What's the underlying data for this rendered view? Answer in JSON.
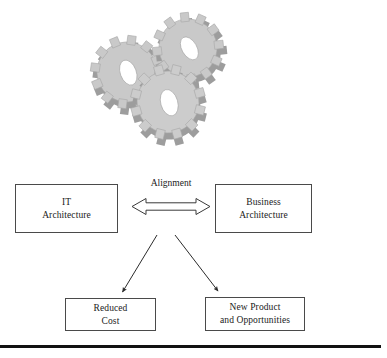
{
  "figure": {
    "name": "it-business-architecture-alignment-diagram",
    "background_color": "#ffffff",
    "illustration": {
      "name": "three-interlocking-gears",
      "gear_count": 3,
      "face_color": "#c9c9c9",
      "shade_color": "#9a9a9a",
      "edge_color": "#8c8c8c",
      "hub_color": "#ffffff"
    },
    "connector_color": "#333333",
    "box_border_color": "#4a4a4a",
    "rule_color": "#111111"
  },
  "diagram": {
    "alignment_label": "Alignment",
    "nodes": [
      {
        "id": "it-architecture",
        "lines": [
          "IT",
          "Architecture"
        ]
      },
      {
        "id": "business-architecture",
        "lines": [
          "Business",
          "Architecture"
        ]
      },
      {
        "id": "reduced-cost",
        "lines": [
          "Reduced",
          "Cost"
        ]
      },
      {
        "id": "new-product",
        "lines": [
          "New Product",
          "and Opportunities"
        ]
      }
    ],
    "edges": [
      {
        "id": "alignment-double-arrow",
        "from": "it-architecture",
        "to": "business-architecture",
        "style": "outline-double-headed",
        "label": "Alignment"
      },
      {
        "id": "arrow-to-reduced-cost",
        "from": "alignment",
        "to": "reduced-cost",
        "style": "solid-single-headed"
      },
      {
        "id": "arrow-to-new-product",
        "from": "alignment",
        "to": "new-product",
        "style": "solid-single-headed"
      }
    ]
  }
}
